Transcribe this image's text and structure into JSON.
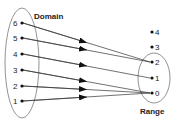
{
  "diagram": {
    "type": "function-mapping",
    "domain": {
      "label": "Domain",
      "elements": [
        "6",
        "5",
        "4",
        "3",
        "2",
        "1"
      ]
    },
    "range": {
      "label": "Range",
      "elements": [
        "4",
        "3",
        "2",
        "1",
        "0"
      ]
    },
    "mappings": [
      {
        "from": "6",
        "to": "2"
      },
      {
        "from": "5",
        "to": "2"
      },
      {
        "from": "4",
        "to": "1"
      },
      {
        "from": "3",
        "to": "0"
      },
      {
        "from": "2",
        "to": "0"
      },
      {
        "from": "1",
        "to": "0"
      }
    ],
    "colors": {
      "line": "#333333",
      "ellipse": "#777777",
      "text": "#222222"
    }
  }
}
